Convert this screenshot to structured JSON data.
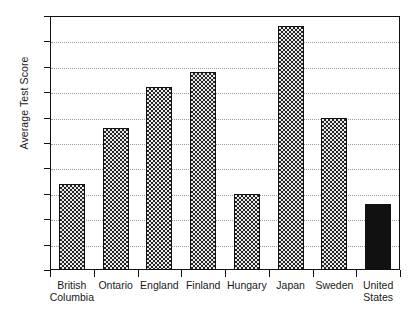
{
  "chart_data": {
    "type": "bar",
    "title": "",
    "xlabel": "",
    "ylabel": "Average Test Score",
    "ylim": [
      30,
      80
    ],
    "ytick_step": 5,
    "yticks": [
      30,
      35,
      40,
      45,
      50,
      55,
      60,
      65,
      70,
      75,
      80
    ],
    "grid": true,
    "legend": "none",
    "categories": [
      "British\nColumbia",
      "Ontario",
      "England",
      "Finland",
      "Hungary",
      "Japan",
      "Sweden",
      "United\nStates"
    ],
    "values": [
      47,
      58,
      66,
      69,
      45,
      78,
      60,
      43
    ],
    "bar_styles": [
      "checkered",
      "checkered",
      "checkered",
      "checkered",
      "checkered",
      "checkered",
      "checkered",
      "solid-black"
    ],
    "colors": {
      "bar_fill": "#e9e9e9",
      "bar_pattern": "#262626",
      "bar_border": "#111111",
      "highlight_bar": "#111111",
      "gridline": "#9a9a9a",
      "axis": "#111111",
      "background": "#ffffff",
      "text": "#1a1a1a"
    }
  }
}
